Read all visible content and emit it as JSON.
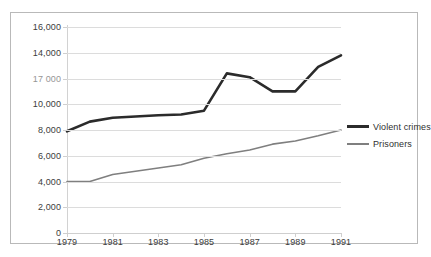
{
  "chart_data": {
    "type": "line",
    "title": "",
    "xlabel": "",
    "ylabel": "",
    "x": [
      1979,
      1980,
      1981,
      1982,
      1983,
      1984,
      1985,
      1986,
      1987,
      1988,
      1989,
      1990,
      1991
    ],
    "xlim": [
      1979,
      1991
    ],
    "ylim": [
      0,
      16000
    ],
    "grid": true,
    "legend_position": "right",
    "x_tick_labels": [
      "1979",
      "1981",
      "1983",
      "1985",
      "1987",
      "1989",
      "1991"
    ],
    "x_tick_values": [
      1979,
      1981,
      1983,
      1985,
      1987,
      1989,
      1991
    ],
    "y_tick_labels": [
      "16,000",
      "14,000",
      "17 000",
      "10,000",
      "8,000",
      "6,000",
      "4,000",
      "2,000",
      "0"
    ],
    "y_tick_values": [
      16000,
      14000,
      12000,
      10000,
      8000,
      6000,
      4000,
      2000,
      0
    ],
    "series": [
      {
        "name": "Violent crimes",
        "color": "#2b2b2b",
        "width": 2.6,
        "values": [
          7900,
          8650,
          8950,
          9050,
          9150,
          9200,
          9500,
          12400,
          12100,
          11000,
          11000,
          12900,
          13800
        ]
      },
      {
        "name": "Prisoners",
        "color": "#7f7f7f",
        "width": 1.6,
        "values": [
          4000,
          4000,
          4550,
          4800,
          5050,
          5300,
          5800,
          6150,
          6450,
          6900,
          7150,
          7550,
          8000
        ]
      }
    ]
  },
  "legend": {
    "entries": [
      {
        "label": "Violent crimes"
      },
      {
        "label": "Prisoners"
      }
    ]
  },
  "colors": {
    "violent_crimes": "#2b2b2b",
    "prisoners": "#7f7f7f",
    "grid": "#dcdcdc",
    "border": "#b9b9b9",
    "background": "#ffffff"
  }
}
